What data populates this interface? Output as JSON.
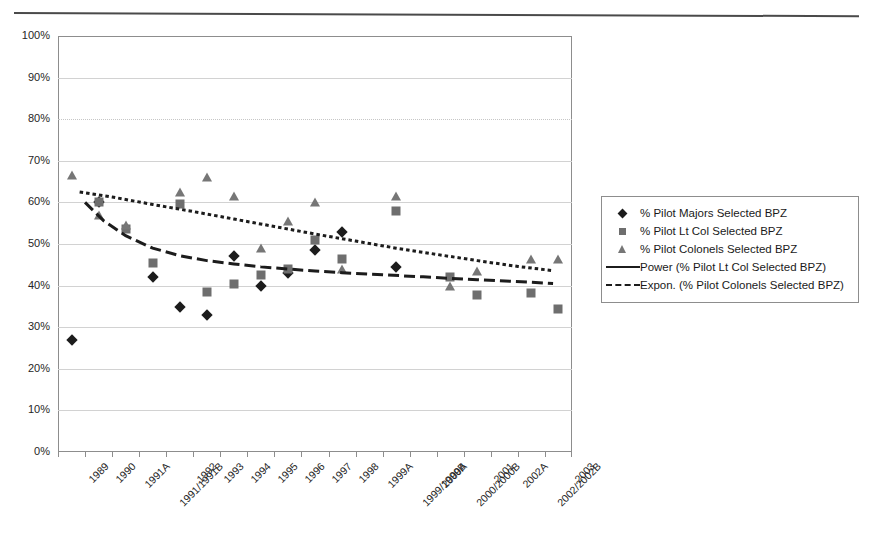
{
  "chart_data": {
    "type": "scatter",
    "title": "",
    "xlabel": "",
    "ylabel": "",
    "ylim": [
      0,
      100
    ],
    "y_unit": "%",
    "grid": "horizontal",
    "legend_position": "right",
    "categories": [
      "1989",
      "1990",
      "1991A",
      "1991/1991B",
      "1992",
      "1993",
      "1994",
      "1995",
      "1996",
      "1997",
      "1998",
      "1999A",
      "1999/1999B",
      "2000A",
      "2000/2000B",
      "2001",
      "2002A",
      "2002/2002B",
      "2003"
    ],
    "ytick_labels": [
      "100%",
      "90%",
      "80%",
      "70%",
      "60%",
      "50%",
      "40%",
      "30%",
      "20%",
      "10%",
      "0%"
    ],
    "ytick_values": [
      100,
      90,
      80,
      70,
      60,
      50,
      40,
      30,
      20,
      10,
      0
    ],
    "series": [
      {
        "name": "% Pilot Majors Selected BPZ",
        "marker": "diamond",
        "color": "#1c1c1c",
        "points": [
          {
            "x": "1989",
            "y": 27
          },
          {
            "x": "1990",
            "y": 60
          },
          {
            "x": "1991/1991B",
            "y": 42
          },
          {
            "x": "1992",
            "y": 34.8
          },
          {
            "x": "1993",
            "y": 33
          },
          {
            "x": "1994",
            "y": 47
          },
          {
            "x": "1995",
            "y": 40
          },
          {
            "x": "1996",
            "y": 43
          },
          {
            "x": "1997",
            "y": 48.5
          },
          {
            "x": "1998",
            "y": 53
          },
          {
            "x": "1999/1999B",
            "y": 44.5
          }
        ]
      },
      {
        "name": "% Pilot Lt Col Selected BPZ",
        "marker": "square",
        "color": "#6e6e6e",
        "points": [
          {
            "x": "1990",
            "y": 60
          },
          {
            "x": "1991A",
            "y": 53.5
          },
          {
            "x": "1991/1991B",
            "y": 45.5
          },
          {
            "x": "1992",
            "y": 59.5
          },
          {
            "x": "1993",
            "y": 38.5
          },
          {
            "x": "1994",
            "y": 40.5
          },
          {
            "x": "1995",
            "y": 42.5
          },
          {
            "x": "1996",
            "y": 44
          },
          {
            "x": "1997",
            "y": 51
          },
          {
            "x": "1998",
            "y": 46.5
          },
          {
            "x": "1999/1999B",
            "y": 58
          },
          {
            "x": "2000/2000B",
            "y": 42
          },
          {
            "x": "2001",
            "y": 37.8
          },
          {
            "x": "2002/2002B",
            "y": 38.3
          },
          {
            "x": "2003",
            "y": 34.3
          }
        ]
      },
      {
        "name": "% Pilot Colonels Selected BPZ",
        "marker": "triangle",
        "color": "#767676",
        "points": [
          {
            "x": "1989",
            "y": 66.5
          },
          {
            "x": "1990",
            "y": 57
          },
          {
            "x": "1991A",
            "y": 54.5
          },
          {
            "x": "1992",
            "y": 62.5
          },
          {
            "x": "1993",
            "y": 66
          },
          {
            "x": "1994",
            "y": 61.5
          },
          {
            "x": "1995",
            "y": 49
          },
          {
            "x": "1996",
            "y": 55.5
          },
          {
            "x": "1997",
            "y": 60
          },
          {
            "x": "1998",
            "y": 44
          },
          {
            "x": "1999/1999B",
            "y": 61.5
          },
          {
            "x": "2000/2000B",
            "y": 40
          },
          {
            "x": "2001",
            "y": 43.5
          },
          {
            "x": "2002/2002B",
            "y": 46.5
          },
          {
            "x": "2003",
            "y": 46.5
          }
        ]
      }
    ],
    "trendlines": [
      {
        "name": "Power (% Pilot Lt Col Selected BPZ)",
        "style": "dash-long",
        "color": "#1c1c1c",
        "points": [
          {
            "x": 0.5,
            "y": 60.0
          },
          {
            "x": 1.2,
            "y": 55.5
          },
          {
            "x": 2.0,
            "y": 52.0
          },
          {
            "x": 3.0,
            "y": 49.0
          },
          {
            "x": 4.0,
            "y": 47.2
          },
          {
            "x": 5.0,
            "y": 46.0
          },
          {
            "x": 6.0,
            "y": 45.2
          },
          {
            "x": 7.0,
            "y": 44.5
          },
          {
            "x": 8.0,
            "y": 44.0
          },
          {
            "x": 9.0,
            "y": 43.5
          },
          {
            "x": 10.0,
            "y": 43.1
          },
          {
            "x": 11.5,
            "y": 42.6
          },
          {
            "x": 13.0,
            "y": 42.1
          },
          {
            "x": 15.0,
            "y": 41.4
          },
          {
            "x": 17.0,
            "y": 40.8
          },
          {
            "x": 17.8,
            "y": 40.5
          }
        ]
      },
      {
        "name": "Expon. (% Pilot Colonels Selected BPZ)",
        "style": "dot-dense",
        "color": "#1c1c1c",
        "points": [
          {
            "x": 0.3,
            "y": 62.5
          },
          {
            "x": 1.5,
            "y": 61.3
          },
          {
            "x": 3.0,
            "y": 59.5
          },
          {
            "x": 4.5,
            "y": 57.8
          },
          {
            "x": 6.0,
            "y": 56.0
          },
          {
            "x": 7.5,
            "y": 54.2
          },
          {
            "x": 9.0,
            "y": 52.4
          },
          {
            "x": 10.5,
            "y": 50.7
          },
          {
            "x": 12.0,
            "y": 49.0
          },
          {
            "x": 13.5,
            "y": 47.5
          },
          {
            "x": 15.0,
            "y": 46.0
          },
          {
            "x": 16.5,
            "y": 44.6
          },
          {
            "x": 17.8,
            "y": 43.6
          }
        ]
      }
    ],
    "legend_entries": [
      {
        "label": "% Pilot Majors Selected BPZ",
        "key": "diamond"
      },
      {
        "label": "% Pilot Lt Col Selected BPZ",
        "key": "square"
      },
      {
        "label": "% Pilot Colonels Selected BPZ",
        "key": "triangle"
      },
      {
        "label": "Power (% Pilot Lt Col Selected BPZ)",
        "key": "line-solid"
      },
      {
        "label": "Expon. (% Pilot Colonels Selected BPZ)",
        "key": "line-dashed"
      }
    ]
  }
}
